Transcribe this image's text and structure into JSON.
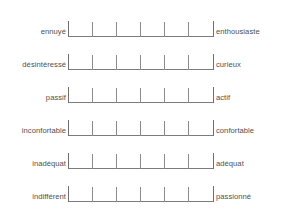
{
  "form": {
    "type": "semantic-differential-scale",
    "language": "fr",
    "scale": {
      "tick_count": 7,
      "interval_count": 6,
      "tick_positions_pct": [
        0,
        16.666,
        33.333,
        50,
        66.666,
        83.333,
        100
      ],
      "line_color": "#7c7c7c",
      "tick_color": "#8a8a8a",
      "background_color": "#ffffff",
      "text_color": "#4f4f4f"
    },
    "rows": [
      {
        "left": "ennuyé",
        "right": "enthousiaste"
      },
      {
        "left": "désintéressé",
        "right": "curieux"
      },
      {
        "left": "passif",
        "right": "actif"
      },
      {
        "left": "inconfortable",
        "right": "confortable"
      },
      {
        "left": "inadéquat",
        "right": "adéquat"
      },
      {
        "left": "indifférent",
        "right": "passionné"
      }
    ]
  }
}
